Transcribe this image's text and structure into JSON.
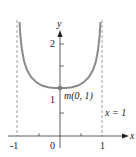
{
  "diagram": {
    "type": "function-graph",
    "function": "y = 1/sqrt(1 - x^2)",
    "axes": {
      "x_label": "x",
      "y_label": "y"
    },
    "x_ticks": [
      "-1",
      "0",
      "1"
    ],
    "y_ticks": [
      "1",
      "2"
    ],
    "point": {
      "label": "m(0, 1)",
      "x": 0,
      "y": 1
    },
    "asymptotes": [
      {
        "x": -1,
        "label": ""
      },
      {
        "x": 1,
        "label": "x = 1"
      }
    ],
    "colors": {
      "curve": "#8a8a8a",
      "axes": "#333333",
      "asymptote": "#777777"
    }
  }
}
